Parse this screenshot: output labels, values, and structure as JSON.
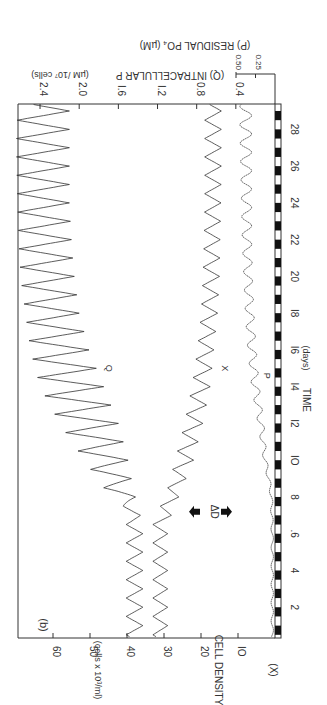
{
  "figure": {
    "panel_label": "(b)",
    "orientation": "rotated 90 degrees clockwise",
    "background": "#ffffff",
    "ink_color": "#333333"
  },
  "chart_data": {
    "type": "line",
    "title": "",
    "panel": "(b)",
    "xlabel": "TIME (days)",
    "x_ticks": [
      2,
      4,
      6,
      8,
      10,
      12,
      14,
      16,
      18,
      20,
      22,
      24,
      26,
      28
    ],
    "x_tick_labels": [
      "2",
      "4",
      ".6",
      "8",
      "IO",
      "I2",
      "I4",
      "I6",
      "I8",
      "20",
      "22",
      "24",
      "26",
      "28"
    ],
    "xlim": [
      0,
      29.5
    ],
    "light_dark_bar": "alternating white/black half-day bars along time axis (12:12 light-dark cycle)",
    "annotation": {
      "label": "ΔD",
      "day": 7.2,
      "marker": "double arrows"
    },
    "axes": [
      {
        "id": "x",
        "label": "(X)  CELL  DENSITY",
        "units": "(cells x 10³/ml)",
        "ticks": [
          10,
          20,
          30,
          40,
          50,
          60
        ],
        "tick_labels": [
          "IO",
          "20",
          "30",
          "40",
          "50",
          "60"
        ],
        "ylim": [
          0,
          69.5
        ]
      },
      {
        "id": "q",
        "label": "(Q)  INTRACELLULAR  P",
        "units": "(µM /10⁷ cells)",
        "ticks": [
          0.4,
          0.8,
          1.2,
          1.6,
          2.0,
          2.4
        ],
        "tick_labels": [
          "0.4",
          "0.8",
          "I.2",
          "I.6",
          "2.0",
          "2.4"
        ],
        "ylim": [
          0,
          2.75
        ]
      },
      {
        "id": "p",
        "label": "(P)  RESIDUAL  PO₄ (µM)",
        "ticks": [
          0.25,
          0.5
        ],
        "tick_labels": [
          "0.25",
          "0.50"
        ],
        "ylim": [
          0,
          0.95
        ]
      }
    ],
    "series": [
      {
        "name": "Q",
        "axis": "q",
        "label_at_day": 15,
        "description": "Oscillates daily; ~1.35-1.52 before day 7, then amplitude grows and level rises to ~2.1-2.65 by day 28",
        "days": [
          0.5,
          3,
          6.5,
          7.5,
          8.5,
          10,
          12,
          14,
          16,
          18,
          20,
          22,
          24,
          26,
          28,
          29.5
        ],
        "peaks": [
          1.52,
          1.52,
          1.52,
          1.55,
          1.75,
          1.95,
          2.2,
          2.4,
          2.5,
          2.55,
          2.6,
          2.62,
          2.63,
          2.64,
          2.64,
          2.62
        ],
        "troughs": [
          1.35,
          1.35,
          1.35,
          1.4,
          1.45,
          1.5,
          1.6,
          1.75,
          1.9,
          2.0,
          2.05,
          2.08,
          2.1,
          2.1,
          2.1,
          2.1
        ]
      },
      {
        "name": "X",
        "axis": "x",
        "label_at_day": 15,
        "description": "Oscillates daily ~28-33 before day 7, then declines to ~14.5-19 by day 28",
        "days": [
          0.5,
          3,
          6.5,
          7.5,
          8.5,
          10,
          12,
          14,
          16,
          18,
          20,
          22,
          24,
          26,
          28,
          29.5
        ],
        "peaks": [
          33,
          33,
          33,
          31,
          29,
          27,
          24.5,
          22.5,
          21,
          20,
          19.5,
          19.2,
          19,
          19,
          19,
          19
        ],
        "troughs": [
          29,
          29,
          29,
          27,
          25,
          22,
          19.5,
          17.5,
          16.5,
          15.5,
          15,
          14.8,
          14.6,
          14.5,
          14.5,
          14.5
        ]
      },
      {
        "name": "P",
        "axis": "p",
        "label_at_day": 14.6,
        "description": "Near 0 (~0.02-0.05) before day 8, then rises with small daily oscillation to ~0.30-0.45 by day 28",
        "days": [
          0.5,
          3,
          6,
          8,
          9,
          10,
          12,
          14,
          16,
          18,
          20,
          22,
          24,
          26,
          28,
          29.5
        ],
        "peaks": [
          0.05,
          0.05,
          0.05,
          0.06,
          0.1,
          0.15,
          0.22,
          0.3,
          0.35,
          0.38,
          0.4,
          0.42,
          0.43,
          0.44,
          0.45,
          0.45
        ],
        "troughs": [
          0.02,
          0.02,
          0.02,
          0.03,
          0.06,
          0.1,
          0.14,
          0.2,
          0.24,
          0.27,
          0.29,
          0.3,
          0.3,
          0.3,
          0.3,
          0.3
        ]
      }
    ],
    "grid": false,
    "legend": "inline curve labels Q, X, P"
  }
}
